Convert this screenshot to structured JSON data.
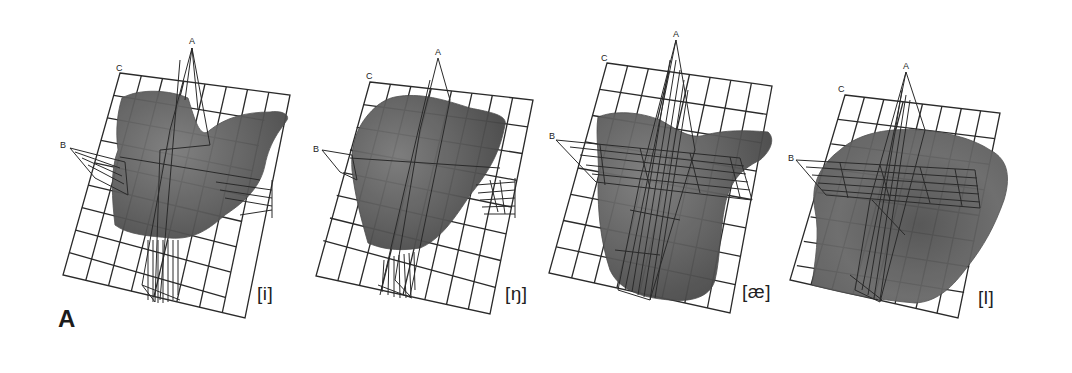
{
  "figure": {
    "panel_letter": "A",
    "grid_color": "#2a2a2a",
    "surface_color": "#5e5e5e",
    "panels": [
      {
        "phoneme": "[i]",
        "plane_labels": {
          "a": "A",
          "b": "B",
          "c": "C"
        }
      },
      {
        "phoneme": "[ŋ]",
        "plane_labels": {
          "a": "A",
          "b": "B",
          "c": "C"
        }
      },
      {
        "phoneme": "[æ]",
        "plane_labels": {
          "a": "A",
          "b": "B",
          "c": "C"
        }
      },
      {
        "phoneme": "[l]",
        "plane_labels": {
          "a": "A",
          "b": "B",
          "c": "C"
        }
      }
    ]
  }
}
